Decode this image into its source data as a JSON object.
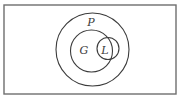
{
  "diagram": {
    "type": "venn",
    "background": "#ffffff",
    "stroke_color": "#3c3c3c",
    "universe": {
      "shape": "rectangle",
      "x": 4,
      "y": 5,
      "width": 172,
      "height": 89,
      "stroke_color": "#6e6e6e"
    },
    "sets": [
      {
        "label": "P",
        "cx": 92.5,
        "cy": 49.5,
        "r": 36.5,
        "label_x": 91,
        "label_y": 26
      },
      {
        "label": "G",
        "cx": 91.5,
        "cy": 51,
        "r": 21,
        "label_x": 84,
        "label_y": 54
      },
      {
        "label": "L",
        "cx": 108,
        "cy": 48.5,
        "r": 11,
        "label_x": 105,
        "label_y": 54
      }
    ],
    "relations": [
      "G is a subset of P",
      "L is inside P",
      "L partially overlaps G"
    ]
  }
}
